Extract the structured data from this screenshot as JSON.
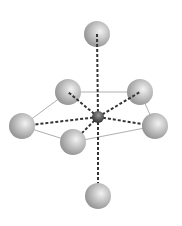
{
  "diagram": {
    "type": "molecular-geometry",
    "geometry": "pentagonal-bipyramidal",
    "center_atom": {
      "id": "M",
      "x": 98,
      "y": 117,
      "r": 6
    },
    "ligands": [
      {
        "id": "axial-top",
        "x": 97,
        "y": 34,
        "r": 13
      },
      {
        "id": "eq-upper-left",
        "x": 68,
        "y": 92,
        "r": 13
      },
      {
        "id": "eq-upper-right",
        "x": 140,
        "y": 92,
        "r": 13
      },
      {
        "id": "eq-far-left",
        "x": 22,
        "y": 126,
        "r": 13
      },
      {
        "id": "eq-far-right",
        "x": 155,
        "y": 126,
        "r": 13
      },
      {
        "id": "eq-front-left",
        "x": 73,
        "y": 142,
        "r": 13
      },
      {
        "id": "axial-bottom",
        "x": 98,
        "y": 196,
        "r": 13
      }
    ],
    "outline_order": [
      "eq-far-left",
      "eq-upper-left",
      "eq-upper-right",
      "eq-far-right",
      "eq-front-left"
    ],
    "colors": {
      "ligand_light": "#f2f2f2",
      "ligand_dark": "#8a8a8a",
      "center_light": "#9a9a9a",
      "center_dark": "#1e1e1e",
      "bond_dashed": "#333333",
      "outline": "#b0b0b0"
    }
  }
}
